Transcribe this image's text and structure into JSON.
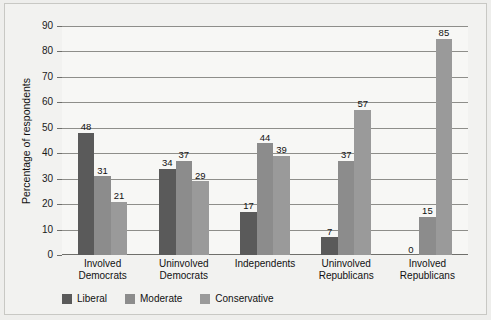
{
  "chart_data": {
    "type": "bar",
    "title": "",
    "subtitle": "",
    "xlabel": "",
    "ylabel": "Percentage of respondents",
    "categories": [
      "Involved Democrats",
      "Uninvolved Democrats",
      "Independents",
      "Uninvolved Republicans",
      "Involved Republicans"
    ],
    "category_lines": [
      [
        "Involved",
        "Democrats"
      ],
      [
        "Uninvolved",
        "Democrats"
      ],
      [
        "Independents",
        ""
      ],
      [
        "Uninvolved",
        "Republicans"
      ],
      [
        "Involved",
        "Republicans"
      ]
    ],
    "series": [
      {
        "name": "Liberal",
        "color": "#5a5a5a",
        "values": [
          48,
          34,
          17,
          7,
          0
        ]
      },
      {
        "name": "Moderate",
        "color": "#8c8c8c",
        "values": [
          31,
          37,
          44,
          37,
          15
        ]
      },
      {
        "name": "Conservative",
        "color": "#9a9a9a",
        "values": [
          21,
          29,
          39,
          57,
          85
        ]
      }
    ],
    "ylim": [
      0,
      90
    ],
    "yticks": [
      0,
      10,
      20,
      30,
      40,
      50,
      60,
      70,
      80,
      90
    ],
    "ytick_labels": [
      "0",
      "10",
      "20",
      "30",
      "40",
      "50",
      "60",
      "70",
      "80",
      "90"
    ],
    "grid": true,
    "legend_position": "bottom-left",
    "background_color": "#f7f7f5",
    "gridline_color": "#8e8e8a"
  }
}
